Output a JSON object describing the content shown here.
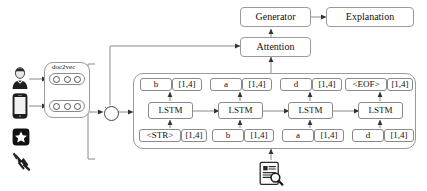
{
  "diagram": {
    "stroke_color": "#8a8a8a",
    "text_color": "#111111",
    "background": "#ffffff"
  },
  "inputs": {
    "icons": [
      {
        "name": "user-icon",
        "label": "user"
      },
      {
        "name": "smartphone-icon",
        "label": "smartphone"
      },
      {
        "name": "star-badge-icon",
        "label": "star"
      },
      {
        "name": "hand-click-icon",
        "label": "click"
      }
    ]
  },
  "doc2vec": {
    "title": "doc2vec",
    "rows": [
      {
        "name": "embedding-row-1",
        "units": 3
      },
      {
        "name": "embedding-row-2",
        "units": 3
      }
    ]
  },
  "operator": {
    "symbol": "x",
    "label": "multiply"
  },
  "top_blocks": {
    "generator": "Generator",
    "explanation": "Explanation",
    "attention": "Attention"
  },
  "sequence": {
    "output_label": "[1,4]",
    "input_label": "[1,4]",
    "lstm_label": "LSTM",
    "steps": [
      {
        "output_token": "b",
        "output_vector": "[1,4]",
        "cell": "LSTM",
        "input_token": "<STR>",
        "input_vector": "[1,4]"
      },
      {
        "output_token": "a",
        "output_vector": "[1,4]",
        "cell": "LSTM",
        "input_token": "b",
        "input_vector": "[1,4]"
      },
      {
        "output_token": "d",
        "output_vector": "[1,4]",
        "cell": "LSTM",
        "input_token": "a",
        "input_vector": "[1,4]"
      },
      {
        "output_token": "<EOF>",
        "output_vector": "[1,4]",
        "cell": "LSTM",
        "input_token": "d",
        "input_vector": "[1,4]"
      }
    ]
  },
  "source_document": {
    "name": "document-search-icon",
    "label": "document"
  }
}
